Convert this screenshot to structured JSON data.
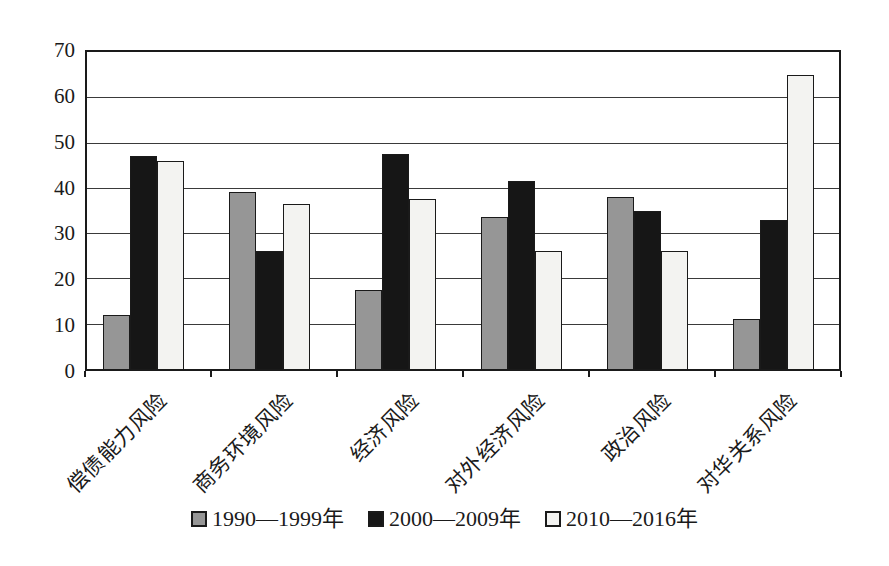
{
  "chart_data": {
    "type": "bar",
    "title": "",
    "categories": [
      "偿债能力风险",
      "商务环境风险",
      "经济风险",
      "对外经济风险",
      "政治风险",
      "对华关系风险"
    ],
    "series": [
      {
        "name": "1990—1999年",
        "color": "#969696",
        "values": [
          12,
          39,
          17.5,
          33.5,
          38,
          11
        ]
      },
      {
        "name": "2000—2009年",
        "color": "#161616",
        "values": [
          47,
          26,
          47.5,
          41.5,
          35,
          33
        ]
      },
      {
        "name": "2010—2016年",
        "color": "#f3f3f1",
        "values": [
          46,
          36.5,
          37.5,
          26,
          26,
          65
        ]
      }
    ],
    "xlabel": "",
    "ylabel": "",
    "ylim": [
      0,
      70
    ],
    "ytick_step": 10,
    "ytick_labels": [
      "0",
      "10",
      "20",
      "30",
      "40",
      "50",
      "60",
      "70"
    ],
    "grid": true,
    "legend_position": "bottom",
    "axis_color": "#1a1a1a",
    "bar_border_color": "#1a1a1a",
    "background_color": "#ffffff"
  }
}
